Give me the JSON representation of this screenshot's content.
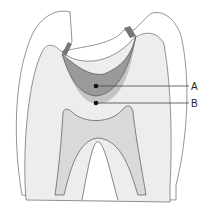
{
  "diagram": {
    "labels": [
      {
        "id": "A",
        "text": "A",
        "points_to": "cavity lesion"
      },
      {
        "id": "B",
        "text": "B",
        "points_to": "affected dentin below lesion"
      }
    ],
    "colors": {
      "background": "#ffffff",
      "enamel": "#ffffff",
      "dentin": "#ececec",
      "cavity": "#9a9a9a",
      "cavity_halo": "#c4c4c4",
      "pulp": "#d9d9d9",
      "outline": "#555555",
      "leader_line": "#444444",
      "dot": "#111111"
    }
  }
}
